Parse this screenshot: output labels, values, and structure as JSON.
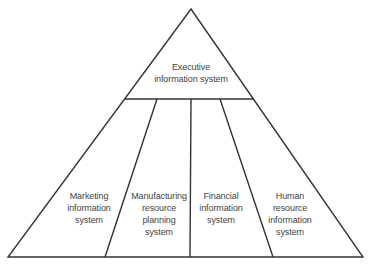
{
  "diagram": {
    "type": "pyramid",
    "line_color": "#333333",
    "text_color": "#444444",
    "top": {
      "lines": [
        "Executive",
        "information system"
      ]
    },
    "segments": [
      {
        "lines": [
          "Marketing",
          "information",
          "system"
        ]
      },
      {
        "lines": [
          "Manufacturing",
          "resource",
          "planning",
          "system"
        ]
      },
      {
        "lines": [
          "Financial",
          "information",
          "system"
        ]
      },
      {
        "lines": [
          "Human",
          "resource",
          "information",
          "system"
        ]
      }
    ]
  }
}
